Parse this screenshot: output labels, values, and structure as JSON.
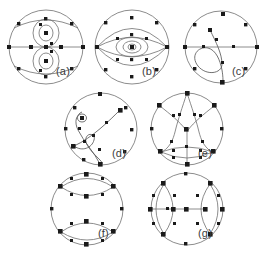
{
  "figure": {
    "title": "",
    "background": "#ffffff",
    "width": 278,
    "height": 254,
    "node_color": "#1a1a1a",
    "curve_color": "#6f6f6f",
    "label_color": "#3b3b3b"
  },
  "panels": [
    {
      "id": "a",
      "label": "(a)",
      "description": "circle with horizontal diameter and two vertically stacked nested ellipse pairs each enclosing a node",
      "x": 6,
      "y": 8,
      "w": 80,
      "h": 78,
      "label_x": 56,
      "label_y": 66
    },
    {
      "id": "b",
      "label": "(b)",
      "description": "circle with horizontal lens eye shape and concentric ellipses converging on a centre node",
      "x": 92,
      "y": 8,
      "w": 80,
      "h": 78,
      "label_x": 142,
      "label_y": 66
    },
    {
      "id": "c",
      "label": "(c)",
      "description": "circle with horizontal diameter and a single curve sweeping into a loop at lower left",
      "x": 182,
      "y": 8,
      "w": 78,
      "h": 78,
      "label_x": 232,
      "label_y": 66
    },
    {
      "id": "d",
      "label": "(d)",
      "description": "circle with two crossing curves each ending in a small spiral loop",
      "x": 62,
      "y": 90,
      "w": 78,
      "h": 78,
      "label_x": 112,
      "label_y": 148
    },
    {
      "id": "e",
      "label": "(e)",
      "description": "circle with star chords converging at a centre node and a lens at the bottom",
      "x": 148,
      "y": 90,
      "w": 78,
      "h": 78,
      "label_x": 198,
      "label_y": 148
    },
    {
      "id": "f",
      "label": "(f)",
      "description": "circle with a lens shape at the top and a lens shape at the bottom",
      "x": 48,
      "y": 170,
      "w": 78,
      "h": 78,
      "label_x": 98,
      "label_y": 228
    },
    {
      "id": "g",
      "label": "(g)",
      "description": "circle with two vertical lens shapes flanking the horizontal diameter",
      "x": 148,
      "y": 170,
      "w": 78,
      "h": 78,
      "label_x": 198,
      "label_y": 228
    }
  ]
}
